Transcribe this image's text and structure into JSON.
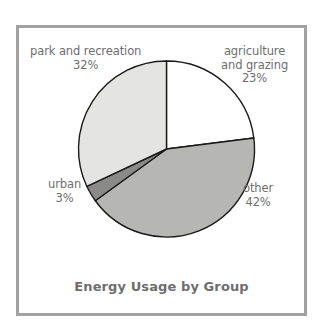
{
  "chart_data": {
    "type": "pie",
    "title": "Energy Usage by Group",
    "xlabel": "",
    "ylabel": "",
    "legend": "none",
    "grid": false,
    "start_angle_deg": 0,
    "direction": "clockwise",
    "categories": [
      "agriculture and grazing",
      "other",
      "urban",
      "park and recreation"
    ],
    "values": [
      23,
      42,
      3,
      32
    ],
    "unit": "percent",
    "slices": [
      {
        "name": "agriculture-and-grazing",
        "label_line1": "agriculture",
        "label_line2": "and grazing",
        "value": 23,
        "value_label": "23%",
        "color": "#ffffff",
        "start_deg": 0,
        "end_deg": 82.8
      },
      {
        "name": "other",
        "label_line1": "other",
        "label_line2": "",
        "value": 42,
        "value_label": "42%",
        "color": "#b6b6b4",
        "start_deg": 82.8,
        "end_deg": 234.0
      },
      {
        "name": "urban",
        "label_line1": "urban",
        "label_line2": "",
        "value": 3,
        "value_label": "3%",
        "color": "#8a8a88",
        "start_deg": 234.0,
        "end_deg": 244.8
      },
      {
        "name": "park-and-recreation",
        "label_line1": "park and recreation",
        "label_line2": "",
        "value": 32,
        "value_label": "32%",
        "color": "#e4e4e2",
        "start_deg": 244.8,
        "end_deg": 360.0
      }
    ]
  },
  "figure": {
    "frame_color": "#a2a2a2",
    "background_color": "#ffffff",
    "label_color": "#6e6e6e",
    "outline_color": "#1a1a1a"
  }
}
